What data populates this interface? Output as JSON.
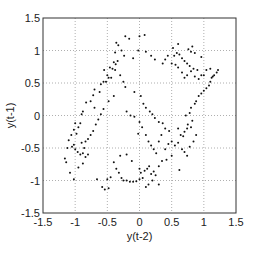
{
  "chart_data": {
    "type": "scatter",
    "title": "",
    "xlabel": "y(t-2)",
    "ylabel": "y(t-1)",
    "xlim": [
      -1.5,
      1.5
    ],
    "ylim": [
      -1.5,
      1.5
    ],
    "xticks": [
      -1.5,
      -1,
      -0.5,
      0,
      0.5,
      1,
      1.5
    ],
    "yticks": [
      -1.5,
      -1,
      -0.5,
      0,
      0.5,
      1,
      1.5
    ],
    "xtick_labels": [
      "-1.5",
      "-1",
      "-0.5",
      "0",
      "0.5",
      "1",
      "1.5"
    ],
    "ytick_labels": [
      "-1.5",
      "-1",
      "-0.5",
      "0",
      "0.5",
      "1",
      "1.5"
    ],
    "grid": true,
    "grid_style": "dotted",
    "legend": null,
    "marker": "dot",
    "marker_color": "#111111",
    "series": [
      {
        "name": "phase points",
        "points": [
          [
            -0.36,
            1.12
          ],
          [
            -0.33,
            1.08
          ],
          [
            -0.38,
            0.97
          ],
          [
            -0.34,
            0.84
          ],
          [
            -0.4,
            0.82
          ],
          [
            -0.37,
            0.79
          ],
          [
            -0.42,
            0.72
          ],
          [
            -0.46,
            0.74
          ],
          [
            -0.38,
            0.7
          ],
          [
            -0.5,
            0.62
          ],
          [
            -0.55,
            0.7
          ],
          [
            -0.48,
            0.58
          ],
          [
            -0.44,
            0.58
          ],
          [
            -0.52,
            0.52
          ],
          [
            -0.56,
            0.52
          ],
          [
            -0.6,
            0.48
          ],
          [
            -0.62,
            0.36
          ],
          [
            -0.7,
            0.4
          ],
          [
            -0.72,
            0.31
          ],
          [
            -0.76,
            0.22
          ],
          [
            -0.83,
            0.2
          ],
          [
            -0.7,
            0.12
          ],
          [
            -0.88,
            0.06
          ],
          [
            -0.9,
            0.02
          ],
          [
            -0.92,
            -0.12
          ],
          [
            -0.95,
            -0.18
          ],
          [
            -1.0,
            -0.12
          ],
          [
            -1.02,
            -0.22
          ],
          [
            -0.98,
            -0.28
          ],
          [
            -1.06,
            -0.3
          ],
          [
            -1.1,
            -0.38
          ],
          [
            -1.12,
            -0.5
          ],
          [
            -1.05,
            -0.48
          ],
          [
            -1.0,
            -0.52
          ],
          [
            -0.96,
            -0.56
          ],
          [
            -0.92,
            -0.6
          ],
          [
            -0.88,
            -0.58
          ],
          [
            -0.86,
            -0.5
          ],
          [
            -1.02,
            -0.45
          ],
          [
            -1.16,
            -0.66
          ],
          [
            -1.14,
            -0.72
          ],
          [
            -1.08,
            -0.88
          ],
          [
            -1.02,
            -0.98
          ],
          [
            -0.95,
            -0.8
          ],
          [
            -0.88,
            -0.74
          ],
          [
            -0.84,
            -0.64
          ],
          [
            -0.8,
            -0.6
          ],
          [
            -0.9,
            -0.42
          ],
          [
            -0.66,
            -0.98
          ],
          [
            -0.58,
            -1.1
          ],
          [
            -0.54,
            -1.14
          ],
          [
            -0.48,
            -1.12
          ],
          [
            -0.5,
            -0.98
          ],
          [
            -0.45,
            -0.95
          ],
          [
            -0.4,
            -0.72
          ],
          [
            -0.36,
            -0.82
          ],
          [
            -0.32,
            -0.88
          ],
          [
            -0.28,
            -0.96
          ],
          [
            -0.25,
            -1.0
          ],
          [
            -0.2,
            -1.0
          ],
          [
            -0.15,
            -1.02
          ],
          [
            -0.1,
            -1.02
          ],
          [
            -0.05,
            -1.01
          ],
          [
            0.0,
            -0.98
          ],
          [
            0.05,
            -0.96
          ],
          [
            0.08,
            -0.85
          ],
          [
            0.12,
            -0.82
          ],
          [
            0.15,
            -0.78
          ],
          [
            0.18,
            -0.9
          ],
          [
            0.22,
            -0.86
          ],
          [
            0.25,
            -0.92
          ],
          [
            0.2,
            -1.0
          ],
          [
            0.14,
            -1.06
          ],
          [
            0.1,
            -1.1
          ],
          [
            0.3,
            -1.06
          ],
          [
            -0.2,
            -0.6
          ],
          [
            -0.3,
            -0.62
          ],
          [
            -0.12,
            -0.7
          ],
          [
            0.0,
            -0.82
          ],
          [
            0.02,
            -0.88
          ],
          [
            0.3,
            -0.78
          ],
          [
            0.35,
            -0.7
          ],
          [
            0.42,
            -0.68
          ],
          [
            0.4,
            -0.52
          ],
          [
            0.45,
            -0.44
          ],
          [
            0.5,
            -0.4
          ],
          [
            0.55,
            -0.46
          ],
          [
            0.6,
            -0.42
          ],
          [
            0.64,
            -0.3
          ],
          [
            0.68,
            -0.32
          ],
          [
            0.7,
            -0.25
          ],
          [
            0.74,
            -0.2
          ],
          [
            0.75,
            -0.14
          ],
          [
            0.8,
            -0.18
          ],
          [
            0.82,
            -0.08
          ],
          [
            0.6,
            -0.2
          ],
          [
            0.66,
            -0.52
          ],
          [
            0.7,
            -0.56
          ],
          [
            0.74,
            -0.62
          ],
          [
            0.78,
            -0.48
          ],
          [
            0.84,
            -0.4
          ],
          [
            0.88,
            -0.3
          ],
          [
            0.5,
            -0.62
          ],
          [
            0.62,
            -0.84
          ],
          [
            0.72,
            0.0
          ],
          [
            0.78,
            0.04
          ],
          [
            0.8,
            0.12
          ],
          [
            0.86,
            0.18
          ],
          [
            0.88,
            0.22
          ],
          [
            0.92,
            0.3
          ],
          [
            0.96,
            0.34
          ],
          [
            1.0,
            0.38
          ],
          [
            1.04,
            0.42
          ],
          [
            1.08,
            0.46
          ],
          [
            1.1,
            0.52
          ],
          [
            1.12,
            0.58
          ],
          [
            1.16,
            0.62
          ],
          [
            1.2,
            0.66
          ],
          [
            1.22,
            0.7
          ],
          [
            1.0,
            0.62
          ],
          [
            0.92,
            0.56
          ],
          [
            0.86,
            0.6
          ],
          [
            0.8,
            0.68
          ],
          [
            0.74,
            0.62
          ],
          [
            0.7,
            0.58
          ],
          [
            0.66,
            0.66
          ],
          [
            0.6,
            0.74
          ],
          [
            0.56,
            0.78
          ],
          [
            0.5,
            0.8
          ],
          [
            0.54,
            0.92
          ],
          [
            0.58,
            0.96
          ],
          [
            0.62,
            0.94
          ],
          [
            0.66,
            0.88
          ],
          [
            0.7,
            0.84
          ],
          [
            0.74,
            0.8
          ],
          [
            0.78,
            0.76
          ],
          [
            0.84,
            0.72
          ],
          [
            0.9,
            0.7
          ],
          [
            0.96,
            0.62
          ],
          [
            1.04,
            0.7
          ],
          [
            1.1,
            0.72
          ],
          [
            1.14,
            0.6
          ],
          [
            0.52,
            1.04
          ],
          [
            0.6,
            1.1
          ],
          [
            0.76,
            1.02
          ],
          [
            0.82,
            1.06
          ],
          [
            0.86,
            0.96
          ],
          [
            0.96,
            0.9
          ],
          [
            0.8,
            0.98
          ],
          [
            0.44,
            0.92
          ],
          [
            0.4,
            0.86
          ],
          [
            0.36,
            0.8
          ],
          [
            -0.22,
            1.22
          ],
          [
            -0.16,
            1.18
          ],
          [
            0.0,
            1.22
          ],
          [
            0.08,
            1.24
          ],
          [
            -0.28,
            1.0
          ],
          [
            -0.24,
            0.92
          ],
          [
            -0.1,
            0.88
          ],
          [
            -0.02,
            1.0
          ],
          [
            0.1,
            0.98
          ],
          [
            0.18,
            0.92
          ],
          [
            0.24,
            0.86
          ],
          [
            -0.3,
            0.62
          ],
          [
            -0.25,
            0.52
          ],
          [
            -0.22,
            0.44
          ],
          [
            -0.08,
            0.36
          ],
          [
            0.02,
            0.3
          ],
          [
            0.06,
            0.18
          ],
          [
            0.1,
            0.12
          ],
          [
            0.16,
            0.06
          ],
          [
            0.2,
            0.02
          ],
          [
            0.24,
            -0.04
          ],
          [
            0.3,
            -0.1
          ],
          [
            0.36,
            -0.12
          ],
          [
            0.4,
            -0.2
          ],
          [
            -0.4,
            0.3
          ],
          [
            -0.48,
            0.22
          ],
          [
            -0.56,
            0.1
          ],
          [
            -0.6,
            0.02
          ],
          [
            -0.64,
            -0.06
          ],
          [
            -0.68,
            -0.14
          ],
          [
            -0.72,
            -0.24
          ],
          [
            -0.76,
            -0.3
          ],
          [
            -0.8,
            -0.36
          ],
          [
            -0.84,
            -0.4
          ],
          [
            -0.2,
            0.06
          ],
          [
            -0.14,
            0.0
          ],
          [
            -0.08,
            -0.02
          ],
          [
            0.0,
            -0.1
          ],
          [
            0.04,
            -0.18
          ],
          [
            -0.02,
            -0.28
          ],
          [
            0.1,
            -0.3
          ],
          [
            0.14,
            -0.4
          ],
          [
            0.18,
            -0.46
          ],
          [
            0.22,
            -0.52
          ],
          [
            0.26,
            -0.58
          ],
          [
            0.3,
            -0.4
          ],
          [
            0.34,
            -0.3
          ],
          [
            0.46,
            -0.24
          ]
        ]
      }
    ]
  }
}
